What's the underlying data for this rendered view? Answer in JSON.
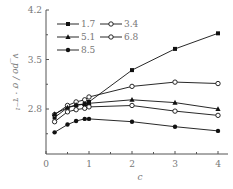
{
  "chart_data": {
    "type": "line",
    "title": "",
    "xlabel": "c",
    "ylabel": "v_po / σ · τ⁻¹",
    "xlim": [
      0,
      4.2
    ],
    "ylim": [
      2.1,
      4.2
    ],
    "xticks": [
      "0",
      "1",
      "2",
      "3",
      "4"
    ],
    "yticks": [
      "2.8",
      "3.5",
      "4.2"
    ],
    "grid": false,
    "legend_position": "upper-left",
    "x": [
      0.2,
      0.5,
      0.7,
      0.9,
      1.0,
      2,
      3,
      4
    ],
    "series": [
      {
        "name": "1.7",
        "marker": "filled-square",
        "values": [
          2.68,
          2.82,
          2.85,
          2.87,
          2.9,
          3.35,
          3.65,
          3.87
        ]
      },
      {
        "name": "3.4",
        "marker": "open-circle",
        "values": [
          2.72,
          2.85,
          2.9,
          2.93,
          2.97,
          3.12,
          3.18,
          3.16
        ]
      },
      {
        "name": "5.1",
        "marker": "filled-triangle",
        "values": [
          2.73,
          2.82,
          2.86,
          2.87,
          2.88,
          2.93,
          2.89,
          2.8
        ]
      },
      {
        "name": "6.8",
        "marker": "open-circle",
        "values": [
          2.62,
          2.76,
          2.79,
          2.81,
          2.83,
          2.85,
          2.77,
          2.71
        ]
      },
      {
        "name": "8.5",
        "marker": "filled-circle",
        "values": [
          2.47,
          2.58,
          2.63,
          2.66,
          2.66,
          2.62,
          2.55,
          2.49
        ]
      }
    ]
  },
  "axis": {
    "xlabel": "c",
    "ylabel": "v_po / σ · τ⁻¹",
    "xtick_labels": [
      "0",
      "1",
      "2",
      "3",
      "4"
    ],
    "ytick_labels": [
      "2.8",
      "3.5",
      "4.2"
    ]
  },
  "legend": {
    "items": [
      "1.7",
      "3.4",
      "5.1",
      "6.8",
      "8.5"
    ]
  },
  "colors": {
    "line": "#111111",
    "text": "#777777"
  }
}
